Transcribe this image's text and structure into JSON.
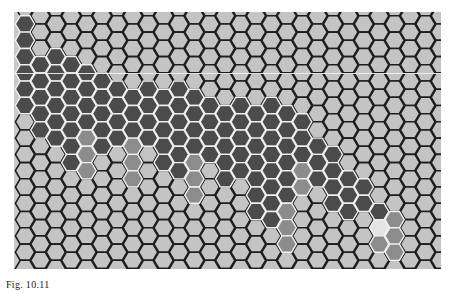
{
  "figure": {
    "caption": "Fig. 10.11",
    "grid": {
      "columns": 28,
      "rows": 16,
      "origin_x": 11,
      "origin_y": 12,
      "col_pitch": 15.4,
      "row_pitch": 16.3,
      "odd_col_offset": 8.15,
      "hex_radius": 9.6,
      "artifact_line_y": 61
    },
    "colors": {
      "background": "#c9c9c9",
      "empty_fill": "#c4c4c4",
      "empty_stroke": "#1e1e1e",
      "dark_fill": "#4b4b4b",
      "medium_fill": "#8c8c8c",
      "highlight_fill": "#e4e4e4",
      "filled_stroke": "#f0f0f0"
    },
    "cells": {
      "dark": [
        [
          0,
          0
        ],
        [
          0,
          1
        ],
        [
          0,
          2
        ],
        [
          0,
          3
        ],
        [
          0,
          4
        ],
        [
          0,
          5
        ],
        [
          1,
          2
        ],
        [
          1,
          3
        ],
        [
          1,
          4
        ],
        [
          1,
          5
        ],
        [
          1,
          6
        ],
        [
          2,
          2
        ],
        [
          2,
          3
        ],
        [
          2,
          4
        ],
        [
          2,
          5
        ],
        [
          2,
          6
        ],
        [
          2,
          7
        ],
        [
          3,
          2
        ],
        [
          3,
          3
        ],
        [
          3,
          4
        ],
        [
          3,
          5
        ],
        [
          3,
          6
        ],
        [
          3,
          7
        ],
        [
          3,
          8
        ],
        [
          4,
          3
        ],
        [
          4,
          4
        ],
        [
          4,
          5
        ],
        [
          4,
          6
        ],
        [
          5,
          3
        ],
        [
          5,
          4
        ],
        [
          5,
          5
        ],
        [
          5,
          6
        ],
        [
          5,
          7
        ],
        [
          6,
          4
        ],
        [
          6,
          5
        ],
        [
          6,
          6
        ],
        [
          6,
          7
        ],
        [
          7,
          4
        ],
        [
          7,
          5
        ],
        [
          7,
          6
        ],
        [
          8,
          4
        ],
        [
          8,
          5
        ],
        [
          8,
          6
        ],
        [
          8,
          7
        ],
        [
          9,
          4
        ],
        [
          9,
          5
        ],
        [
          9,
          6
        ],
        [
          9,
          7
        ],
        [
          9,
          8
        ],
        [
          10,
          4
        ],
        [
          10,
          5
        ],
        [
          10,
          6
        ],
        [
          10,
          7
        ],
        [
          10,
          8
        ],
        [
          10,
          9
        ],
        [
          11,
          4
        ],
        [
          11,
          5
        ],
        [
          11,
          6
        ],
        [
          11,
          7
        ],
        [
          12,
          5
        ],
        [
          12,
          6
        ],
        [
          12,
          7
        ],
        [
          12,
          8
        ],
        [
          13,
          5
        ],
        [
          13,
          6
        ],
        [
          13,
          7
        ],
        [
          13,
          8
        ],
        [
          13,
          9
        ],
        [
          14,
          5
        ],
        [
          14,
          6
        ],
        [
          14,
          7
        ],
        [
          14,
          8
        ],
        [
          14,
          9
        ],
        [
          15,
          5
        ],
        [
          15,
          6
        ],
        [
          15,
          7
        ],
        [
          15,
          8
        ],
        [
          15,
          9
        ],
        [
          15,
          10
        ],
        [
          15,
          11
        ],
        [
          16,
          5
        ],
        [
          16,
          6
        ],
        [
          16,
          7
        ],
        [
          16,
          8
        ],
        [
          16,
          9
        ],
        [
          16,
          10
        ],
        [
          16,
          11
        ],
        [
          16,
          12
        ],
        [
          17,
          5
        ],
        [
          17,
          6
        ],
        [
          17,
          7
        ],
        [
          17,
          8
        ],
        [
          17,
          9
        ],
        [
          17,
          10
        ],
        [
          18,
          6
        ],
        [
          18,
          7
        ],
        [
          18,
          8
        ],
        [
          19,
          7
        ],
        [
          19,
          8
        ],
        [
          19,
          9
        ],
        [
          20,
          8
        ],
        [
          20,
          9
        ],
        [
          20,
          10
        ],
        [
          20,
          11
        ],
        [
          21,
          9
        ],
        [
          21,
          10
        ],
        [
          21,
          11
        ],
        [
          22,
          10
        ],
        [
          22,
          11
        ],
        [
          23,
          11
        ]
      ],
      "medium": [
        [
          4,
          7
        ],
        [
          4,
          8
        ],
        [
          4,
          9
        ],
        [
          7,
          7
        ],
        [
          7,
          8
        ],
        [
          7,
          9
        ],
        [
          11,
          8
        ],
        [
          11,
          9
        ],
        [
          11,
          10
        ],
        [
          17,
          11
        ],
        [
          17,
          12
        ],
        [
          17,
          13
        ],
        [
          18,
          9
        ],
        [
          18,
          10
        ],
        [
          23,
          13
        ],
        [
          24,
          12
        ],
        [
          24,
          13
        ],
        [
          24,
          14
        ]
      ],
      "highlight": [
        [
          23,
          12
        ]
      ]
    }
  }
}
